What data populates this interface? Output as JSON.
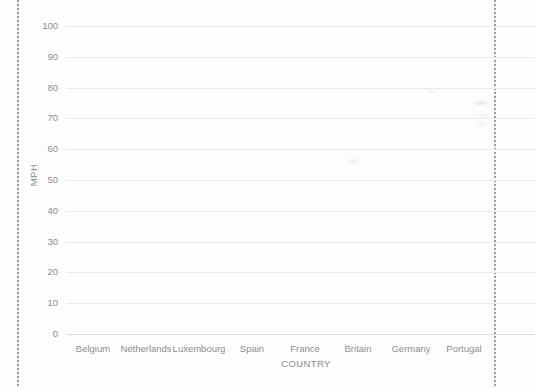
{
  "chart_data": {
    "type": "bar",
    "title": "",
    "xlabel": "COUNTRY",
    "ylabel": "MPH",
    "categories": [
      "Belgium",
      "Netherlands",
      "Luxembourg",
      "Spain",
      "France",
      "Britain",
      "Germany",
      "Portugal"
    ],
    "series": [],
    "values_plotted": "none - empty chart grid with no data series visible",
    "y_ticks": [
      100,
      90,
      80,
      70,
      60,
      50,
      40,
      30,
      20,
      10,
      0
    ],
    "ylim": [
      0,
      100
    ],
    "grid": true,
    "legend": "none"
  },
  "page": {
    "type_note": "scanned printed chart on perforated page",
    "edge_marks": "dotted perforation line at left and right page edges"
  }
}
